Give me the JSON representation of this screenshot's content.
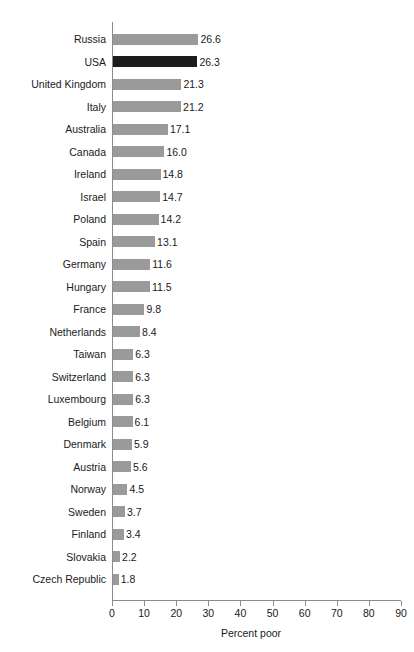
{
  "chart_data": {
    "type": "bar",
    "orientation": "horizontal",
    "title": "",
    "xlabel": "Percent poor",
    "ylabel": "",
    "xlim": [
      0,
      90
    ],
    "xticks": [
      0,
      10,
      20,
      30,
      40,
      50,
      60,
      70,
      80,
      90
    ],
    "xtick_labels": [
      "0",
      "10",
      "20",
      "30",
      "40",
      "50",
      "60",
      "70",
      "80",
      "90"
    ],
    "grid": false,
    "legend": "none",
    "value_label_format": "one-decimal",
    "categories": [
      "Russia",
      "USA",
      "United Kingdom",
      "Italy",
      "Australia",
      "Canada",
      "Ireland",
      "Israel",
      "Poland",
      "Spain",
      "Germany",
      "Hungary",
      "France",
      "Netherlands",
      "Taiwan",
      "Switzerland",
      "Luxembourg",
      "Belgium",
      "Denmark",
      "Austria",
      "Norway",
      "Sweden",
      "Finland",
      "Slovakia",
      "Czech Republic"
    ],
    "values": [
      26.6,
      26.3,
      21.3,
      21.2,
      17.1,
      16.0,
      14.8,
      14.7,
      14.2,
      13.1,
      11.6,
      11.5,
      9.8,
      8.4,
      6.3,
      6.3,
      6.3,
      6.1,
      5.9,
      5.6,
      4.5,
      3.7,
      3.4,
      2.2,
      1.8
    ],
    "value_labels": [
      "26.6",
      "26.3",
      "21.3",
      "21.2",
      "17.1",
      "16.0",
      "14.8",
      "14.7",
      "14.2",
      "13.1",
      "11.6",
      "11.5",
      "9.8",
      "8.4",
      "6.3",
      "6.3",
      "6.3",
      "6.1",
      "5.9",
      "5.6",
      "4.5",
      "3.7",
      "3.4",
      "2.2",
      "1.8"
    ],
    "highlight_category": "USA",
    "colors": {
      "bar": "#9a9a9a",
      "bar_highlight": "#1c1c1c",
      "axis": "#8c8c8c",
      "text": "#1a1a1a",
      "background": "#ffffff"
    }
  }
}
